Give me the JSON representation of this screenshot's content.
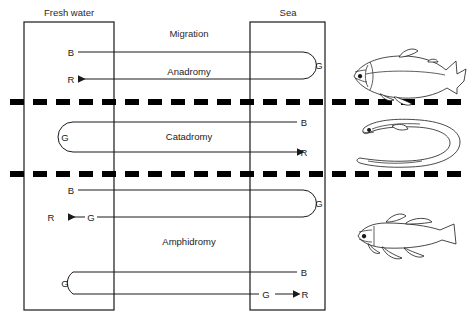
{
  "figure": {
    "title_label": "Migration",
    "habitat_left": "Fresh water",
    "habitat_right": "Sea"
  },
  "panels": [
    {
      "id": "anadromy",
      "name": "Anadromy",
      "fish_icon": "salmon-icon",
      "paths": [
        {
          "start": "B",
          "start_side": "left",
          "turn": "G",
          "turn_side": "right",
          "end": "R",
          "end_side": "left"
        }
      ]
    },
    {
      "id": "catadromy",
      "name": "Catadromy",
      "fish_icon": "eel-icon",
      "paths": [
        {
          "start": "B",
          "start_side": "right",
          "turn": "G",
          "turn_side": "left",
          "end": "R",
          "end_side": "right"
        }
      ]
    },
    {
      "id": "amphidromy",
      "name": "Amphidromy",
      "fish_icon": "goby-icon",
      "paths": [
        {
          "start": "B",
          "start_side": "left",
          "turn": "G",
          "turn_side": "right",
          "mid": "G",
          "end": "R",
          "end_side": "left"
        },
        {
          "start": "B",
          "start_side": "right",
          "turn": "G",
          "turn_side": "left",
          "mid": "G",
          "end": "R",
          "end_side": "right"
        }
      ]
    }
  ],
  "nodes": {
    "anadromy_B": "B",
    "anadromy_G": "G",
    "anadromy_R": "R",
    "catadromy_B": "B",
    "catadromy_G": "G",
    "catadromy_R": "R",
    "amphidromy_top_B": "B",
    "amphidromy_top_G_right": "G",
    "amphidromy_top_G_mid": "G",
    "amphidromy_top_R": "R",
    "amphidromy_bot_B": "B",
    "amphidromy_bot_G_left": "G",
    "amphidromy_bot_G_mid": "G",
    "amphidromy_bot_R": "R"
  },
  "colors": {
    "ink": "#1a1a1a",
    "boundary": "#000000",
    "background": "#ffffff"
  }
}
